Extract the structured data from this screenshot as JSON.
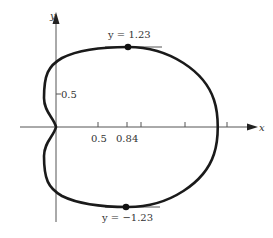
{
  "diagram": {
    "type": "polar curve plot",
    "axes": {
      "x_label": "x",
      "y_label": "y",
      "x_ticks": [
        "0.5",
        "0.84"
      ],
      "y_ticks": [
        "0.5"
      ]
    },
    "annotations": {
      "max_label": "y = 1.23",
      "min_label": "y = −1.23"
    },
    "colors": {
      "curve": "#1a1a1a",
      "axes": "#555555",
      "text": "#333333"
    }
  }
}
